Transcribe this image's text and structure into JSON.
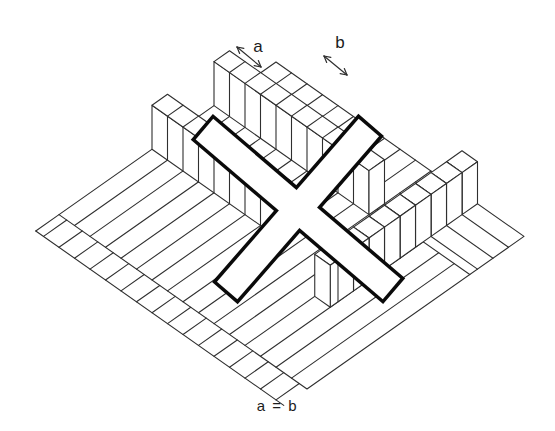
{
  "figure": {
    "kind": "isometric-line-illustration",
    "labels": {
      "a": "a",
      "b": "b",
      "equation": "a = b"
    }
  },
  "colors": {
    "background": "#ffffff",
    "line": "#2f2f2f",
    "fill": "#ffffff",
    "cross_outline": "#0a0a0a",
    "text": "#1c1c1c"
  },
  "scene": {
    "iso": {
      "x0": 276,
      "y0": 62,
      "b2": 15.5,
      "b1": 10.9
    },
    "floor": {
      "ni": 16,
      "nj": 14
    },
    "apron": {
      "j0": 14,
      "j1": 15.5
    },
    "patch": {
      "i0": 10,
      "j1": 3.5
    },
    "walls": [
      {
        "j0": 3,
        "i0": 0,
        "i1": 10,
        "h": 44
      },
      {
        "j0": 7,
        "i0": 0,
        "i1": 8,
        "h": 44
      }
    ],
    "pillars": {
      "i0": 12,
      "h": 42,
      "row": [
        {
          "j0": 0,
          "len": 1
        },
        {
          "j0": 1,
          "len": 1
        },
        {
          "j0": 2,
          "len": 1
        },
        {
          "j0": 3,
          "len": 1
        },
        {
          "j0": 4,
          "len": 1
        },
        {
          "j0": 5,
          "len": 1
        },
        {
          "j0": 6,
          "len": 1
        },
        {
          "j0": 7,
          "len": 1
        },
        {
          "j0": 8,
          "len": 1.5
        }
      ]
    },
    "cross": {
      "cx": 298,
      "cy": 209,
      "half_width": 13.5,
      "stroke": 7,
      "bars": [
        {
          "angle": 40.5,
          "half_len": 123
        },
        {
          "angle": -49,
          "half_len": 108
        }
      ]
    },
    "arrows": {
      "a": {
        "x1": 237,
        "y1": 47,
        "x2": 261,
        "y2": 67
      },
      "b": {
        "x1": 324,
        "y1": 56,
        "x2": 347,
        "y2": 75
      }
    },
    "label_pos": {
      "a": {
        "x": 258,
        "y": 38
      },
      "b": {
        "x": 340,
        "y": 34
      }
    },
    "line_width": 1.1
  }
}
